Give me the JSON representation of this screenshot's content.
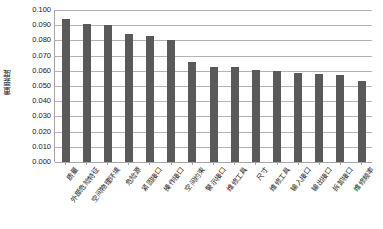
{
  "chart_data": {
    "type": "bar",
    "title": "",
    "xlabel": "",
    "ylabel": "重要度",
    "ylim": [
      0.0,
      0.1
    ],
    "ytick_step": 0.01,
    "grid": true,
    "legend": "none",
    "bar_color": "#595959",
    "gridline_color": "#b3b3b3",
    "axis_color": "#a6a6a6",
    "ytick_labels": [
      "0.100",
      "0.090",
      "0.080",
      "0.070",
      "0.060",
      "0.050",
      "0.040",
      "0.030",
      "0.020",
      "0.010",
      "0.000"
    ],
    "categories": [
      "质量",
      "外部危险特征",
      "空间物理环境",
      "危险源",
      "紧固接口",
      "操作接口",
      "空间约束",
      "警示接口",
      "维修工具",
      "尺寸",
      "维修工具",
      "输入接口",
      "输出接口",
      "拆卸接口",
      "维修频率"
    ],
    "values": [
      0.094,
      0.091,
      0.09,
      0.084,
      0.083,
      0.08,
      0.0655,
      0.0625,
      0.0625,
      0.0605,
      0.06,
      0.0585,
      0.058,
      0.057,
      0.053
    ]
  }
}
